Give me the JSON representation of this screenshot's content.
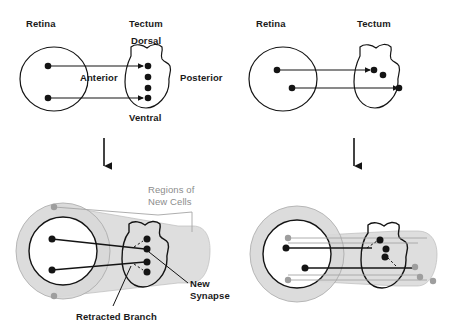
{
  "figure": {
    "colors": {
      "ink": "#141414",
      "gray_fill": "#d8d8d8",
      "gray_stroke": "#9a9a9a",
      "gray_text": "#8c8c8c",
      "background": "#ffffff"
    },
    "panels": [
      {
        "id": "top-left",
        "labels": {
          "retina": "Retina",
          "tectum": "Tectum",
          "dorsal": "Dorsal",
          "ventral": "Ventral",
          "anterior": "Anterior",
          "posterior": "Posterior"
        },
        "retina_cells": 2,
        "tectum_cells": 4,
        "connections": 2
      },
      {
        "id": "top-right",
        "labels": {
          "retina": "Retina",
          "tectum": "Tectum"
        },
        "retina_cells": 2,
        "tectum_cells": 4,
        "connections": 2
      },
      {
        "id": "bottom-left",
        "labels": {
          "regions_of_new_cells": "Regions of\nNew Cells",
          "regions_line1": "Regions of",
          "regions_line2": "New Cells",
          "new_synapse_line1": "New",
          "new_synapse_line2": "Synapse",
          "retracted_branch": "Retracted Branch"
        },
        "retina_cells": 2,
        "retina_new_cells": 2,
        "tectum_cells": 4,
        "connections": 2,
        "retracted_branches": 2
      },
      {
        "id": "bottom-right",
        "labels": {},
        "retina_cells": 2,
        "retina_new_cells": 2,
        "tectum_cells": 4,
        "connections": 2,
        "retracted_branches": 2
      }
    ],
    "arrows": [
      {
        "id": "arrow-left",
        "direction": "down"
      },
      {
        "id": "arrow-right",
        "direction": "down"
      }
    ]
  }
}
